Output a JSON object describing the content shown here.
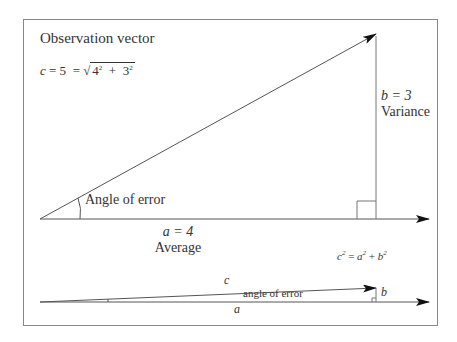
{
  "diagram": {
    "title": "Observation vector",
    "formula_top": {
      "c": "c",
      "eq1": "= 5",
      "eq2": "=",
      "radical": "√",
      "a": "4",
      "plus": "+",
      "b": "3",
      "exp": "2"
    },
    "side_b": {
      "var": "b = 3",
      "label": "Variance"
    },
    "side_a": {
      "var": "a = 4",
      "label": "Average"
    },
    "angle_label": "Angle of error",
    "pythagoras": {
      "c": "c",
      "a": "a",
      "b": "b",
      "exp": "2",
      "eq": "=",
      "plus": "+"
    },
    "small_triangle": {
      "c": "c",
      "b": "b",
      "a": "a",
      "angle_label": "angle of error"
    },
    "colors": {
      "line": "#555555",
      "frame": "#888888",
      "text": "#333333"
    }
  }
}
